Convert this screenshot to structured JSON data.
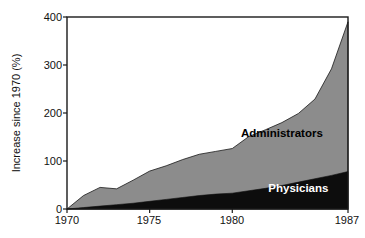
{
  "chart_data": {
    "type": "area",
    "stacked": true,
    "title": "",
    "subtitle": "",
    "xlabel": "",
    "ylabel": "Increase since 1970 (%)",
    "xlim": [
      1970,
      1987
    ],
    "ylim": [
      0,
      400
    ],
    "grid": false,
    "legend_position": "inline-annotation",
    "x": [
      1970,
      1971,
      1972,
      1973,
      1974,
      1975,
      1976,
      1977,
      1978,
      1979,
      1980,
      1981,
      1982,
      1983,
      1984,
      1985,
      1986,
      1987
    ],
    "xticks": [
      1970,
      1975,
      1980,
      1987
    ],
    "xticklabels": [
      "1970",
      "1975",
      "1980",
      "1987"
    ],
    "yticks": [
      0,
      100,
      200,
      300,
      400
    ],
    "yticklabels": [
      "0",
      "100",
      "200",
      "300",
      "400"
    ],
    "series": [
      {
        "name": "Physicians",
        "color": "#0d0d0d",
        "label_color": "#ffffff",
        "values": [
          0,
          3,
          6,
          9,
          12,
          16,
          20,
          24,
          28,
          31,
          33,
          38,
          43,
          49,
          56,
          63,
          70,
          78
        ]
      },
      {
        "name": "Administrators",
        "color": "#8c8c8c",
        "label_color": "#000000",
        "values": [
          0,
          25,
          39,
          33,
          48,
          63,
          70,
          79,
          86,
          89,
          93,
          113,
          122,
          131,
          143,
          166,
          222,
          312
        ]
      }
    ],
    "totals": [
      0,
      28,
      45,
      42,
      60,
      79,
      90,
      103,
      114,
      120,
      126,
      151,
      165,
      180,
      199,
      229,
      292,
      390
    ],
    "annotations": [
      {
        "text": "Administrators",
        "x": 1983.0,
        "y": 150
      },
      {
        "text": "Physicians",
        "x": 1984.0,
        "y": 35
      }
    ]
  },
  "axis": {
    "y_title": "Increase since 1970 (%)",
    "y_tick_0": "0",
    "y_tick_1": "100",
    "y_tick_2": "200",
    "y_tick_3": "300",
    "y_tick_4": "400",
    "x_tick_0": "1970",
    "x_tick_1": "1975",
    "x_tick_2": "1980",
    "x_tick_3": "1987"
  },
  "labels": {
    "administrators": "Administrators",
    "physicians": "Physicians"
  },
  "colors": {
    "administrators_fill": "#8c8c8c",
    "physicians_fill": "#0d0d0d",
    "frame": "#1a1a1a",
    "background": "#ffffff",
    "text": "#111111"
  }
}
